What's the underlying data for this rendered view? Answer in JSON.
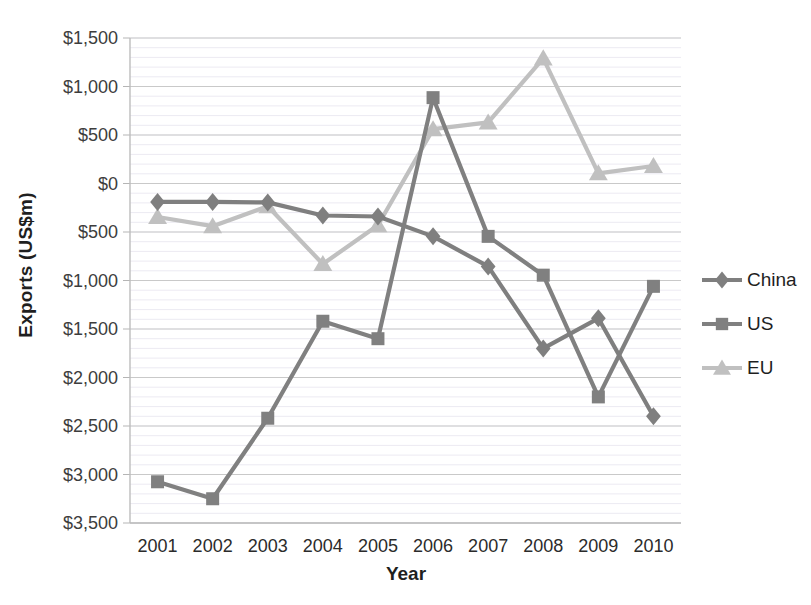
{
  "chart_data": {
    "type": "line",
    "title": "",
    "xlabel": "Year",
    "ylabel": "Exports (US$m)",
    "categories": [
      "2001",
      "2002",
      "2003",
      "2004",
      "2005",
      "2006",
      "2007",
      "2008",
      "2009",
      "2010"
    ],
    "ylim": [
      -3500,
      1500
    ],
    "ytick_values": [
      1500,
      1000,
      500,
      0,
      -500,
      -1000,
      -1500,
      -2000,
      -2500,
      -3000,
      -3500
    ],
    "ytick_labels": [
      "$1,500",
      "$1,000",
      "$500",
      "$0",
      "$500",
      "$1,000",
      "$1,500",
      "$2,000",
      "$2,500",
      "$3,000",
      "$3,500"
    ],
    "grid": true,
    "legend_position": "right",
    "series": [
      {
        "name": "China",
        "color": "#7f7f7f",
        "marker": "diamond",
        "values": [
          -190,
          -190,
          -195,
          -330,
          -340,
          -545,
          -855,
          -1700,
          -1390,
          -2400
        ]
      },
      {
        "name": "US",
        "color": "#808080",
        "marker": "square",
        "values": [
          -3075,
          -3250,
          -2420,
          -1420,
          -1600,
          885,
          -545,
          -945,
          -2200,
          -1060
        ]
      },
      {
        "name": "EU",
        "color": "#c0c0c0",
        "marker": "triangle",
        "values": [
          -345,
          -440,
          -235,
          -830,
          -430,
          560,
          630,
          1290,
          105,
          180
        ]
      }
    ]
  },
  "legend": {
    "items": [
      {
        "label": "China"
      },
      {
        "label": "US"
      },
      {
        "label": "EU"
      }
    ]
  },
  "axes": {
    "y_title": "Exports (US$m)",
    "x_title": "Year"
  }
}
